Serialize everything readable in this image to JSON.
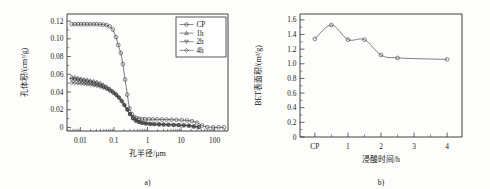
{
  "figure": {
    "panels": [
      {
        "tag": "a)",
        "chart_data": {
          "type": "line",
          "title": "",
          "xlabel": "孔半径/μm",
          "ylabel": "孔体积/(cm³/g)",
          "xscale": "log",
          "xlim": [
            0.004,
            250
          ],
          "ylim": [
            -0.004,
            0.128
          ],
          "xticklabels": [
            "0.01",
            "0.1",
            "1",
            "10",
            "100"
          ],
          "xtickvalues": [
            0.01,
            0.1,
            1,
            10,
            100
          ],
          "yticklabels": [
            "0",
            "0.02",
            "0.04",
            "0.06",
            "0.08",
            "0.10",
            "0.12"
          ],
          "ytickvalues": [
            0,
            0.02,
            0.04,
            0.06,
            0.08,
            0.1,
            0.12
          ],
          "grid": false,
          "legend_position": "top-right",
          "series": [
            {
              "name": "CP",
              "marker": "circle",
              "x": [
                0.0055,
                0.0068,
                0.0085,
                0.0105,
                0.013,
                0.016,
                0.02,
                0.025,
                0.031,
                0.039,
                0.048,
                0.06,
                0.075,
                0.093,
                0.115,
                0.135,
                0.16,
                0.185,
                0.215,
                0.25,
                0.29,
                0.34,
                0.4,
                0.47,
                0.56,
                0.68,
                0.85,
                1.1,
                1.45,
                1.95,
                2.7,
                3.7,
                5.2,
                7.3,
                10.5,
                15.0,
                21.0,
                30.0,
                42.0,
                60.0,
                90.0,
                130.0,
                190.0
              ],
              "y": [
                0.1165,
                0.1165,
                0.1165,
                0.1165,
                0.1165,
                0.1165,
                0.1165,
                0.1165,
                0.1165,
                0.1163,
                0.116,
                0.1155,
                0.114,
                0.1105,
                0.102,
                0.093,
                0.084,
                0.0715,
                0.054,
                0.037,
                0.0215,
                0.015,
                0.012,
                0.0105,
                0.0098,
                0.0095,
                0.0094,
                0.0093,
                0.0092,
                0.0091,
                0.009,
                0.0089,
                0.0088,
                0.0086,
                0.0083,
                0.0079,
                0.0072,
                0.0055,
                0.0022,
                0.0004,
                0.0002,
                0.0001,
                0.0001
              ]
            },
            {
              "name": "1h",
              "marker": "triangle-up",
              "x": [
                0.0055,
                0.0068,
                0.0085,
                0.0105,
                0.013,
                0.016,
                0.02,
                0.025,
                0.031,
                0.039,
                0.048,
                0.06,
                0.075,
                0.093,
                0.115,
                0.14,
                0.17,
                0.205,
                0.25,
                0.3,
                0.37,
                0.45,
                0.56,
                0.7,
                0.9,
                1.2,
                1.6,
                2.2,
                3.0,
                4.2,
                6.0,
                8.5,
                12.0,
                17.0,
                24.0,
                34.0
              ],
              "y": [
                0.057,
                0.0565,
                0.0558,
                0.055,
                0.0543,
                0.0537,
                0.053,
                0.0522,
                0.0512,
                0.05,
                0.0483,
                0.0462,
                0.0438,
                0.0412,
                0.0383,
                0.0348,
                0.0305,
                0.0258,
                0.0205,
                0.0152,
                0.0105,
                0.0078,
                0.0062,
                0.0052,
                0.0046,
                0.0041,
                0.0038,
                0.0035,
                0.0033,
                0.0031,
                0.0029,
                0.0027,
                0.0024,
                0.002,
                0.0012,
                0.0004
              ]
            },
            {
              "name": "2h",
              "marker": "triangle-down",
              "x": [
                0.0055,
                0.0068,
                0.0085,
                0.0105,
                0.013,
                0.016,
                0.02,
                0.025,
                0.031,
                0.039,
                0.048,
                0.06,
                0.075,
                0.093,
                0.115,
                0.14,
                0.17,
                0.205,
                0.25,
                0.3,
                0.37,
                0.45,
                0.56,
                0.7,
                0.9,
                1.2,
                1.6,
                2.2,
                3.0,
                4.2,
                6.0,
                8.5,
                12.0,
                17.0,
                24.0,
                34.0
              ],
              "y": [
                0.054,
                0.0535,
                0.0528,
                0.052,
                0.0514,
                0.0508,
                0.0501,
                0.0493,
                0.0484,
                0.0472,
                0.0457,
                0.0438,
                0.0416,
                0.0392,
                0.0365,
                0.0333,
                0.0293,
                0.0248,
                0.0198,
                0.0147,
                0.0102,
                0.0076,
                0.006,
                0.005,
                0.0044,
                0.0039,
                0.0036,
                0.0034,
                0.0032,
                0.003,
                0.0028,
                0.0026,
                0.0023,
                0.0019,
                0.0011,
                0.0004
              ]
            },
            {
              "name": "4h",
              "marker": "diamond",
              "x": [
                0.0055,
                0.0068,
                0.0085,
                0.0105,
                0.013,
                0.016,
                0.02,
                0.025,
                0.031,
                0.039,
                0.048,
                0.06,
                0.075,
                0.093,
                0.115,
                0.14,
                0.17,
                0.205,
                0.25,
                0.3,
                0.37,
                0.45,
                0.56,
                0.7,
                0.9,
                1.2,
                1.6,
                2.2,
                3.0,
                4.2,
                6.0,
                8.5,
                12.0,
                17.0,
                24.0,
                34.0
              ],
              "y": [
                0.0505,
                0.0502,
                0.0498,
                0.0494,
                0.049,
                0.0486,
                0.0481,
                0.0476,
                0.0469,
                0.046,
                0.0448,
                0.0432,
                0.0413,
                0.039,
                0.0364,
                0.0334,
                0.0296,
                0.0252,
                0.0203,
                0.0152,
                0.0106,
                0.0079,
                0.0062,
                0.0052,
                0.0045,
                0.004,
                0.0037,
                0.0035,
                0.0033,
                0.0031,
                0.0029,
                0.0027,
                0.0024,
                0.002,
                0.0012,
                0.0004
              ]
            }
          ]
        }
      },
      {
        "tag": "b)",
        "chart_data": {
          "type": "line",
          "title": "",
          "xlabel": "浸酸时间/h",
          "ylabel": "BET表面积/(m²/g)",
          "xscale": "linear",
          "xlim": [
            -0.45,
            4.45
          ],
          "ylim": [
            0,
            1.68
          ],
          "xticklabels": [
            "CP",
            "1",
            "2",
            "3",
            "4"
          ],
          "xtickvalues": [
            0,
            1,
            2,
            3,
            4
          ],
          "yticklabels": [
            "0",
            "0.2",
            "0.4",
            "0.6",
            "0.8",
            "1.0",
            "1.2",
            "1.4",
            "1.6"
          ],
          "ytickvalues": [
            0,
            0.2,
            0.4,
            0.6,
            0.8,
            1.0,
            1.2,
            1.4,
            1.6
          ],
          "grid": false,
          "legend_position": "none",
          "series": [
            {
              "name": "BET surface area",
              "marker": "circle",
              "x": [
                0,
                0.5,
                1.0,
                1.5,
                2.0,
                2.5,
                4.0
              ],
              "y": [
                1.34,
                1.53,
                1.33,
                1.33,
                1.12,
                1.08,
                1.06
              ]
            }
          ]
        }
      }
    ]
  }
}
